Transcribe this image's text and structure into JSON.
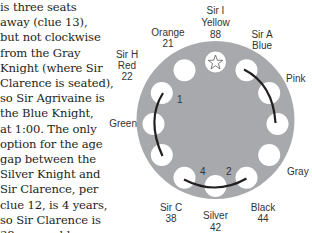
{
  "explanation": {
    "lines": [
      "is three seats",
      "away (clue 13),",
      "but not clockwise",
      "from the Gray",
      "Knight (where Sir",
      "Clarence is seated),",
      "so Sir Agrivaine is",
      "the Blue Knight,",
      "at 1:00. The only",
      "option for the age",
      "gap between the",
      "Silver Knight and",
      "Sir Clarence, per",
      "clue 12, is 4 years,",
      "so Sir Clarence is",
      "38 years old."
    ]
  },
  "table": {
    "fill_color": "#a7a9ac",
    "seat_color": "#ffffff",
    "line_color": "#231f20",
    "seats": [
      {
        "position": "12:00",
        "knight": "Sir I",
        "color": "Yellow",
        "age": "88",
        "icon": "star-icon"
      },
      {
        "position": "1:00",
        "knight": "Sir A",
        "color": "Blue",
        "age": ""
      },
      {
        "position": "2:00",
        "knight": "",
        "color": "Pink",
        "age": ""
      },
      {
        "position": "3:00",
        "knight": "",
        "color": "",
        "age": ""
      },
      {
        "position": "4:00",
        "knight": "",
        "color": "Gray",
        "age": ""
      },
      {
        "position": "5:00",
        "knight": "",
        "color": "Black",
        "age": "44"
      },
      {
        "position": "6:00",
        "knight": "",
        "color": "Silver",
        "age": "42"
      },
      {
        "position": "7:00",
        "knight": "Sir C",
        "color": "",
        "age": "38"
      },
      {
        "position": "8:00",
        "knight": "",
        "color": "",
        "age": ""
      },
      {
        "position": "9:00",
        "knight": "",
        "color": "Green",
        "age": ""
      },
      {
        "position": "10:00",
        "knight": "Sir H",
        "color": "Red",
        "age": "22"
      },
      {
        "position": "11:00",
        "knight": "",
        "color": "Orange",
        "age": "21"
      }
    ],
    "arc_labels": {
      "left_arc": "1",
      "bottom_arc_left": "4",
      "bottom_arc_right": "2"
    }
  },
  "labels": {
    "sir_i": "Sir I",
    "yellow": "Yellow",
    "age_88": "88",
    "sir_a": "Sir A",
    "blue": "Blue",
    "pink": "Pink",
    "gray": "Gray",
    "black": "Black",
    "age_44": "44",
    "silver": "Silver",
    "age_42": "42",
    "sir_c": "Sir C",
    "age_38": "38",
    "green": "Green",
    "sir_h": "Sir H",
    "red": "Red",
    "age_22": "22",
    "orange": "Orange",
    "age_21": "21",
    "arc_1": "1",
    "arc_4": "4",
    "arc_2": "2"
  }
}
